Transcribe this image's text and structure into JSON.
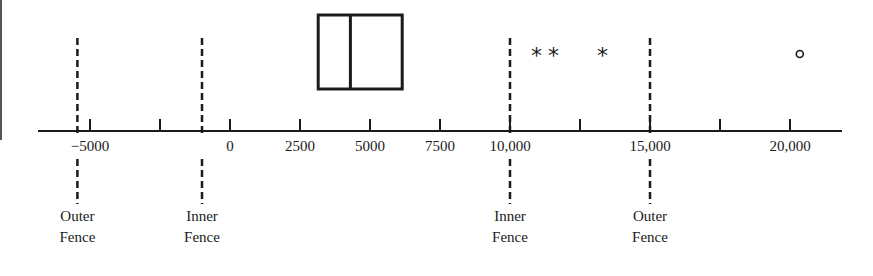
{
  "chart_data": {
    "type": "boxplot",
    "title": "",
    "xlabel": "",
    "ylabel": "",
    "xlim": [
      -7000,
      22000
    ],
    "grid": false,
    "ticks": [
      {
        "value": -5000,
        "label": "−5000"
      },
      {
        "value": -2500,
        "label": ""
      },
      {
        "value": 0,
        "label": "0"
      },
      {
        "value": 2500,
        "label": "2500"
      },
      {
        "value": 5000,
        "label": "5000"
      },
      {
        "value": 7500,
        "label": "7500"
      },
      {
        "value": 10000,
        "label": "10,000"
      },
      {
        "value": 12500,
        "label": ""
      },
      {
        "value": 15000,
        "label": "15,000"
      },
      {
        "value": 17500,
        "label": ""
      },
      {
        "value": 20000,
        "label": "20,000"
      }
    ],
    "box": {
      "q1": 3150,
      "median": 4300,
      "q3": 6150
    },
    "fences": [
      {
        "name": "lower-outer",
        "value": -5450,
        "label_line1": "Outer",
        "label_line2": "Fence"
      },
      {
        "name": "lower-inner",
        "value": -1000,
        "label_line1": "Inner",
        "label_line2": "Fence"
      },
      {
        "name": "upper-inner",
        "value": 10000,
        "label_line1": "Inner",
        "label_line2": "Fence"
      },
      {
        "name": "upper-outer",
        "value": 15000,
        "label_line1": "Outer",
        "label_line2": "Fence"
      }
    ],
    "outliers": [
      {
        "value": 10950,
        "symbol": "*",
        "kind": "mild"
      },
      {
        "value": 11550,
        "symbol": "*",
        "kind": "mild"
      },
      {
        "value": 13300,
        "symbol": "*",
        "kind": "mild"
      },
      {
        "value": 20350,
        "symbol": "○",
        "kind": "extreme"
      }
    ]
  }
}
